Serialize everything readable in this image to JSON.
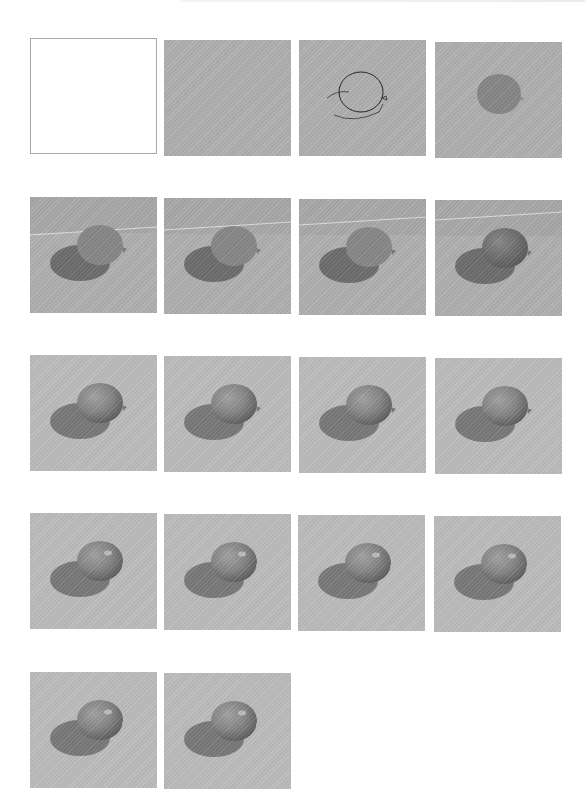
{
  "figure": {
    "background_color": "#ffffff",
    "paper_color": "#b2b2b2",
    "stages": [
      {
        "index": 1,
        "kind": "blank-paper",
        "x": 30,
        "y": 38
      },
      {
        "index": 2,
        "kind": "toned-ground",
        "x": 164,
        "y": 40
      },
      {
        "index": 3,
        "kind": "line-sketch",
        "x": 299,
        "y": 40
      },
      {
        "index": 4,
        "kind": "base-shape",
        "x": 435,
        "y": 42
      },
      {
        "index": 5,
        "kind": "shadow-block-in",
        "x": 30,
        "y": 197
      },
      {
        "index": 6,
        "kind": "shadow-block-in",
        "x": 164,
        "y": 198
      },
      {
        "index": 7,
        "kind": "shadow-block-in",
        "x": 299,
        "y": 199
      },
      {
        "index": 8,
        "kind": "form-shading",
        "x": 435,
        "y": 200
      },
      {
        "index": 9,
        "kind": "refinement",
        "x": 30,
        "y": 355
      },
      {
        "index": 10,
        "kind": "refinement",
        "x": 164,
        "y": 356
      },
      {
        "index": 11,
        "kind": "refinement",
        "x": 299,
        "y": 357
      },
      {
        "index": 12,
        "kind": "refinement",
        "x": 435,
        "y": 358
      },
      {
        "index": 13,
        "kind": "highlights",
        "x": 30,
        "y": 513
      },
      {
        "index": 14,
        "kind": "highlights",
        "x": 164,
        "y": 514
      },
      {
        "index": 15,
        "kind": "highlights",
        "x": 298,
        "y": 515
      },
      {
        "index": 16,
        "kind": "highlights",
        "x": 434,
        "y": 516
      },
      {
        "index": 17,
        "kind": "final",
        "x": 30,
        "y": 672
      },
      {
        "index": 18,
        "kind": "final",
        "x": 164,
        "y": 673
      }
    ]
  }
}
